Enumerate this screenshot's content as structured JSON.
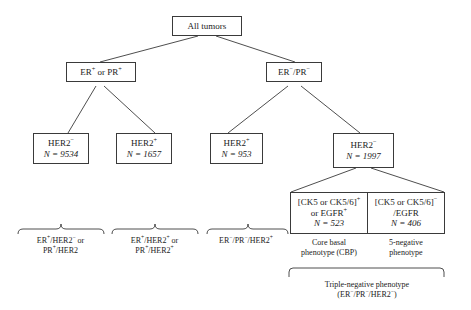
{
  "diagram": {
    "stroke_color": "#3a3a3a",
    "background": "#ffffff"
  },
  "nodes": {
    "all_tumors": {
      "line1": "All tumors"
    },
    "er_pr_pos": {
      "line1": "ER+ or PR+"
    },
    "er_pr_neg": {
      "line1": "ER−/PR−"
    },
    "her2_neg_left": {
      "line1": "HER2−",
      "line2": "N = 9534",
      "n": 9534
    },
    "her2_pos_left": {
      "line1": "HER2+",
      "line2": "N = 1657",
      "n": 1657
    },
    "her2_pos_right": {
      "line1": "HER2+",
      "line2": "N = 953",
      "n": 953
    },
    "her2_neg_right": {
      "line1": "HER2−",
      "line2": "N = 1997",
      "n": 1997
    },
    "cbp": {
      "line1": "[CK5 or CK5/6]+",
      "line2": "or EGFR+",
      "line3": "N = 523",
      "n": 523
    },
    "five_negative": {
      "line1": "[CK5 or CK5/6]−",
      "line2": "/EGFR",
      "line3": "N = 406",
      "n": 406
    }
  },
  "bracket_labels": {
    "group1": {
      "line1": "ER+/HER2− or",
      "line2": "PR+/HER2"
    },
    "group2": {
      "line1": "ER+/HER2+ or",
      "line2": "PR+/HER2+"
    },
    "group3": {
      "line1": "ER−/PR−/HER2+"
    },
    "cbp_label": {
      "line1": "Core basal",
      "line2": "phenotype (CBP)"
    },
    "five_neg_label": {
      "line1": "5-negative",
      "line2": "phenotype"
    },
    "triple_negative": {
      "line1": "Triple-negative phenotype",
      "line2": "(ER−/PR−/HER2−)"
    }
  }
}
